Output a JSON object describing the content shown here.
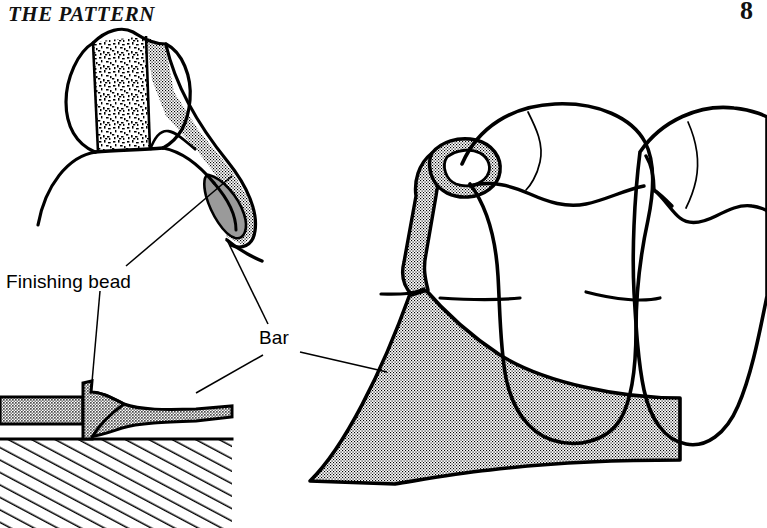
{
  "page": {
    "running_head": "THE PATTERN",
    "page_number": "8",
    "background_color": "#ffffff",
    "ink_color": "#000000"
  },
  "figure": {
    "labels": [
      {
        "id": "finishing-bead",
        "text": "Finishing bead",
        "x": 6,
        "y": 271,
        "leaders": [
          {
            "to": "upper-left-bead",
            "x1": 126,
            "y1": 266,
            "x2": 232,
            "y2": 176
          },
          {
            "to": "lower-left-bead",
            "x1": 100,
            "y1": 291,
            "x2": 92,
            "y2": 382
          }
        ]
      },
      {
        "id": "bar",
        "text": "Bar",
        "x": 259,
        "y": 327,
        "leaders": [
          {
            "to": "upper-left-bar",
            "x1": 268,
            "y1": 324,
            "x2": 226,
            "y2": 238
          },
          {
            "to": "lower-left-bar",
            "x1": 263,
            "y1": 355,
            "x2": 196,
            "y2": 393
          },
          {
            "to": "right-major-connector",
            "x1": 300,
            "y1": 352,
            "x2": 387,
            "y2": 372
          }
        ]
      }
    ],
    "panels": [
      {
        "id": "upper-left-cross-section",
        "description": "Cross section of tooth and saddle showing acrylic resin, stippled bar and solid gray finishing bead"
      },
      {
        "id": "lower-left-cross-section",
        "description": "Cross section of bar over hatched cast with finishing bead ridge"
      },
      {
        "id": "right-occlusal-view",
        "description": "Two molar teeth with clasp arm and large stippled major connector bar"
      }
    ],
    "fills": {
      "coarse_speckle": "acrylic-resin-speckle",
      "fine_stipple": "metal-bar-stipple",
      "solid_gray": "#9a9a9a",
      "hatching": "cast-hatching"
    }
  }
}
